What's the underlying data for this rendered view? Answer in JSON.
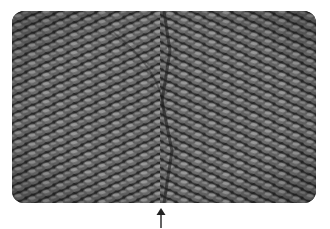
{
  "figure": {
    "colors": {
      "background": "#ffffff",
      "fabric_dark": "#1e1e1e",
      "fabric_mid": "#5a5a5a",
      "fabric_light": "#8c8c8c",
      "arrow": "#222222"
    },
    "annotation": {
      "type": "arrow",
      "direction": "up",
      "icon": "arrow-up-icon"
    }
  }
}
